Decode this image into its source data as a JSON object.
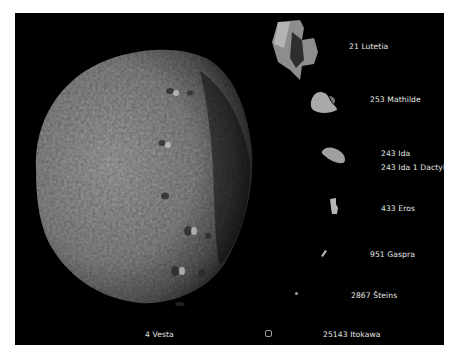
{
  "figure": {
    "background": "#000000",
    "asteroids": [
      {
        "name": "4 Vesta",
        "label_pos": [
          130,
          318
        ]
      },
      {
        "name": "25143 Itokawa",
        "label_pos": [
          308,
          318
        ],
        "marker": "square-outline"
      },
      {
        "name": "21 Lutetia",
        "label_pos": [
          334,
          5
        ]
      },
      {
        "name": "253 Mathilde",
        "label_pos": [
          355,
          83
        ]
      },
      {
        "name": "243 Ida",
        "label_pos": [
          366,
          137
        ]
      },
      {
        "name": "243 Ida 1 Dactyl",
        "label_pos": [
          366,
          151
        ]
      },
      {
        "name": "433 Eros",
        "label_pos": [
          366,
          192
        ]
      },
      {
        "name": "951 Gaspra",
        "label_pos": [
          355,
          238
        ]
      },
      {
        "name": "2867 Šteins",
        "label_pos": [
          336,
          279
        ]
      }
    ]
  }
}
